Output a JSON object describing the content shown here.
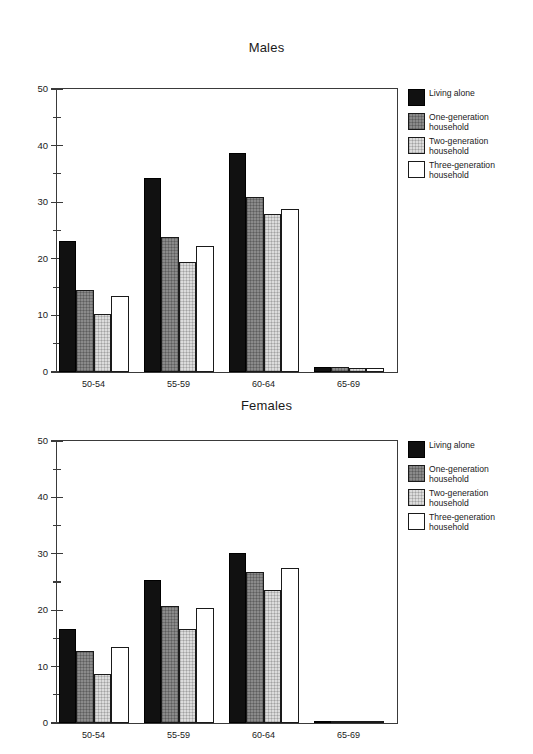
{
  "chart_data": [
    {
      "type": "bar",
      "title": "Males",
      "xlabel": "",
      "ylabel": "",
      "ylim": [
        0,
        50
      ],
      "ytick_major": [
        0,
        10,
        20,
        30,
        40,
        50
      ],
      "ytick_minor": [
        5,
        15,
        25,
        35,
        45
      ],
      "grid": false,
      "legend_position": "right",
      "categories": [
        "50-54",
        "55-59",
        "60-64",
        "65-69"
      ],
      "series": [
        {
          "name": "Living alone",
          "color": "#111111",
          "values": [
            23.2,
            34.2,
            38.7,
            0.8
          ]
        },
        {
          "name": "One-generation household",
          "color": "#8a8a8a",
          "values": [
            14.5,
            23.9,
            31.0,
            0.8
          ]
        },
        {
          "name": "Two-generation household",
          "color": "#dcdcdc",
          "values": [
            10.3,
            19.4,
            28.0,
            0.7
          ]
        },
        {
          "name": "Three-generation household",
          "color": "#ffffff",
          "values": [
            13.4,
            22.3,
            28.8,
            0.7
          ]
        }
      ]
    },
    {
      "type": "bar",
      "title": "Females",
      "xlabel": "",
      "ylabel": "",
      "ylim": [
        0,
        50
      ],
      "ytick_major": [
        0,
        10,
        20,
        30,
        40,
        50
      ],
      "ytick_minor": [
        5,
        15,
        25,
        35,
        45
      ],
      "grid": false,
      "legend_position": "right",
      "categories": [
        "50-54",
        "55-59",
        "60-64",
        "65-69"
      ],
      "series": [
        {
          "name": "Living alone",
          "color": "#111111",
          "values": [
            16.7,
            25.3,
            30.2,
            0.4
          ]
        },
        {
          "name": "One-generation household",
          "color": "#8a8a8a",
          "values": [
            12.7,
            20.7,
            26.8,
            0.4
          ]
        },
        {
          "name": "Two-generation household",
          "color": "#dcdcdc",
          "values": [
            8.7,
            16.7,
            23.5,
            0.3
          ]
        },
        {
          "name": "Three-generation household",
          "color": "#ffffff",
          "values": [
            13.4,
            20.4,
            27.4,
            0.3
          ]
        }
      ]
    }
  ],
  "legend": {
    "entries": [
      {
        "label": "Living alone"
      },
      {
        "label": "One-generation\nhousehold"
      },
      {
        "label": "Two-generation\nhousehold"
      },
      {
        "label": "Three-generation\nhousehold"
      }
    ]
  }
}
